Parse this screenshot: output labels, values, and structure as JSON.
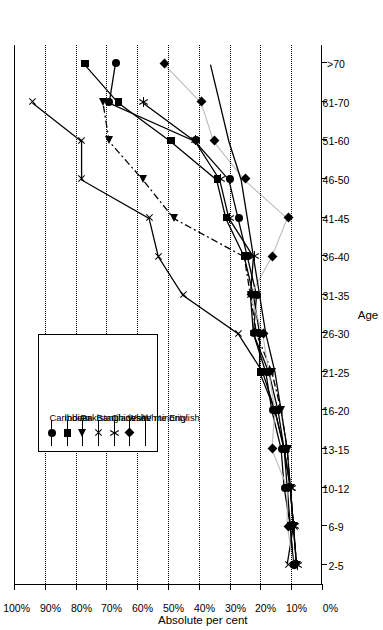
{
  "chart_data": {
    "type": "line",
    "title": "",
    "xlabel": "Age",
    "ylabel": "Absolute per cent",
    "categories": [
      "2-5",
      "6-9",
      "10-12",
      "13-15",
      "16-20",
      "21-25",
      "26-30",
      "31-35",
      "36-40",
      "41-45",
      "46-50",
      "51-60",
      "61-70",
      ">70"
    ],
    "yticks": [
      "0%",
      "10%",
      "20%",
      "30%",
      "40%",
      "50%",
      "60%",
      "70%",
      "80%",
      "90%",
      "100%"
    ],
    "ylim": [
      0,
      100
    ],
    "ystep": 10,
    "grid": "horizontal-dotted",
    "legend_position": "inside-left",
    "series": [
      {
        "name": "Caribbean",
        "marker": "circle",
        "line": "solid",
        "values": [
          9,
          10,
          12,
          13,
          16,
          18,
          22,
          21,
          24,
          27,
          30,
          41,
          69,
          67
        ]
      },
      {
        "name": "Indian",
        "marker": "square",
        "line": "solid",
        "values": [
          9,
          10,
          11,
          12,
          15,
          20,
          20,
          22,
          25,
          31,
          34,
          49,
          66,
          77
        ]
      },
      {
        "name": "Pakistani",
        "marker": "triangle",
        "line": "dashdot",
        "values": [
          8,
          9,
          10,
          11,
          13,
          16,
          21,
          23,
          25,
          48,
          58,
          69,
          71,
          null
        ]
      },
      {
        "name": "Bangladeshi",
        "marker": "x-thin",
        "line": "solid",
        "values": [
          11,
          9,
          10,
          12,
          15,
          19,
          27,
          45,
          53,
          56,
          78,
          78,
          94,
          null
        ]
      },
      {
        "name": "Chinese",
        "marker": "star",
        "line": "solid",
        "values": [
          8,
          9,
          10,
          12,
          14,
          17,
          22,
          23,
          22,
          30,
          33,
          41,
          58,
          null
        ]
      },
      {
        "name": "White minority",
        "marker": "diamond",
        "line": "solid-light",
        "values": [
          9,
          11,
          11,
          16,
          15,
          17,
          19,
          23,
          16,
          11,
          25,
          35,
          39,
          51
        ]
      },
      {
        "name": "White English",
        "marker": "none",
        "line": "solid",
        "values": [
          8,
          9,
          10,
          11,
          13,
          15,
          18,
          20,
          22,
          24,
          26,
          30,
          33,
          36
        ]
      }
    ]
  },
  "legend": {
    "items": [
      {
        "label": "Caribbean",
        "marker": "circle"
      },
      {
        "label": "Indian",
        "marker": "square"
      },
      {
        "label": "Pakistani",
        "marker": "triangle"
      },
      {
        "label": "Bangladeshi",
        "marker": "x-thin"
      },
      {
        "label": "Chinese",
        "marker": "star"
      },
      {
        "label": "White minority",
        "marker": "diamond"
      },
      {
        "label": "White English",
        "marker": "none"
      }
    ]
  },
  "colors": {
    "ink": "#000000",
    "background": "#ffffff",
    "light_line": "#bdbdbd"
  }
}
